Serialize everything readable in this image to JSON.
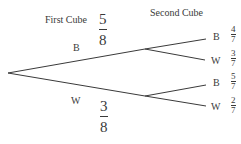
{
  "diagram": {
    "type": "probability-tree",
    "headers": {
      "first": "First Cube",
      "second": "Second Cube"
    },
    "first_level": [
      {
        "outcome": "B",
        "prob_num": "5",
        "prob_den": "8"
      },
      {
        "outcome": "W",
        "prob_num": "3",
        "prob_den": "8"
      }
    ],
    "second_level": [
      {
        "parent": "B",
        "outcome": "B",
        "prob_num": "4",
        "prob_den": "7"
      },
      {
        "parent": "B",
        "outcome": "W",
        "prob_num": "3",
        "prob_den": "7"
      },
      {
        "parent": "W",
        "outcome": "B",
        "prob_num": "5",
        "prob_den": "7"
      },
      {
        "parent": "W",
        "outcome": "W",
        "prob_num": "2",
        "prob_den": "7"
      }
    ],
    "line_color": "#3a3a3a"
  }
}
